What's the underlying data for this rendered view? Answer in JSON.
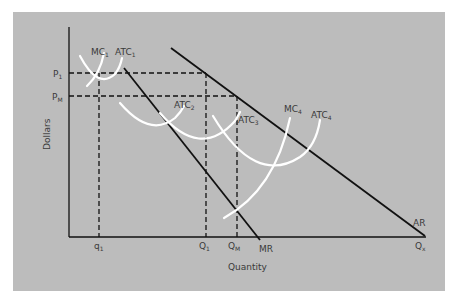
{
  "diagram": {
    "type": "economics-cost-revenue-diagram",
    "colors": {
      "background": "#bcbcbc",
      "lines": "#111111",
      "curves": "#ffffff",
      "text": "#3a3a3a"
    },
    "axes": {
      "y_label": "Dollars",
      "x_label": "Quantity"
    },
    "y_ticks": [
      {
        "main": "P",
        "sub": "1"
      },
      {
        "main": "P",
        "sub": "M"
      }
    ],
    "x_ticks": [
      {
        "main": "q",
        "sub": "1"
      },
      {
        "main": "Q",
        "sub": "1"
      },
      {
        "main": "Q",
        "sub": "M"
      },
      {
        "main": "Q",
        "sub": "x"
      }
    ],
    "curve_labels": {
      "mc1": {
        "main": "MC",
        "sub": "1"
      },
      "atc1": {
        "main": "ATC",
        "sub": "1"
      },
      "atc2": {
        "main": "ATC",
        "sub": "2"
      },
      "atc3": {
        "main": "ATC",
        "sub": "3"
      },
      "mc4": {
        "main": "MC",
        "sub": "4"
      },
      "atc4": {
        "main": "ATC",
        "sub": "4"
      },
      "ar": "AR",
      "mr": "MR"
    }
  }
}
